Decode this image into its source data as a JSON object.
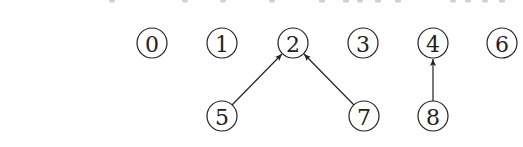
{
  "diagram": {
    "type": "directed-forest",
    "colors": {
      "stroke": "#222222",
      "background": "#ffffff"
    },
    "node_radius": 15,
    "nodes": [
      {
        "id": "0",
        "label": "0",
        "x": 152,
        "y": 43
      },
      {
        "id": "1",
        "label": "1",
        "x": 222,
        "y": 43
      },
      {
        "id": "2",
        "label": "2",
        "x": 293,
        "y": 43
      },
      {
        "id": "3",
        "label": "3",
        "x": 363,
        "y": 43
      },
      {
        "id": "4",
        "label": "4",
        "x": 433,
        "y": 43
      },
      {
        "id": "6",
        "label": "6",
        "x": 502,
        "y": 43
      },
      {
        "id": "5",
        "label": "5",
        "x": 222,
        "y": 116
      },
      {
        "id": "7",
        "label": "7",
        "x": 364,
        "y": 116
      },
      {
        "id": "8",
        "label": "8",
        "x": 433,
        "y": 116
      }
    ],
    "edges": [
      {
        "from": "5",
        "to": "2",
        "x1": 232,
        "y1": 105,
        "x2": 282,
        "y2": 54
      },
      {
        "from": "7",
        "to": "2",
        "x1": 354,
        "y1": 105,
        "x2": 304,
        "y2": 54
      },
      {
        "from": "8",
        "to": "4",
        "x1": 433,
        "y1": 101,
        "x2": 433,
        "y2": 59
      }
    ],
    "top_cut_glyph_x": [
      112,
      185,
      223,
      272,
      322,
      346,
      360,
      378,
      398,
      453,
      468,
      485,
      502
    ]
  }
}
